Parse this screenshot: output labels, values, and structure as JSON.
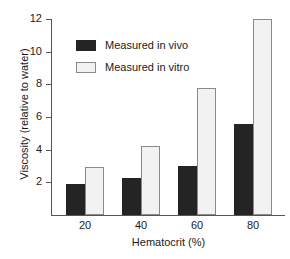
{
  "chart_data": {
    "type": "bar",
    "title": "",
    "xlabel": "Hematocrit (%)",
    "ylabel": "Viscosity (relative to water)",
    "categories": [
      "20",
      "40",
      "60",
      "80"
    ],
    "series": [
      {
        "name": "Measured in vivo",
        "values": [
          1.9,
          2.25,
          3.0,
          5.6
        ],
        "color": "#242424"
      },
      {
        "name": "Measured in vitro",
        "values": [
          2.95,
          4.25,
          7.8,
          12.0
        ],
        "color": "#f2f2f2"
      }
    ],
    "ylim": [
      0,
      12
    ],
    "yticks": [
      2,
      4,
      6,
      8,
      10,
      12
    ],
    "ytick_labels": [
      "2",
      "4",
      "6",
      "8",
      "10",
      "12"
    ],
    "xtick_labels": [
      "20",
      "40",
      "60",
      "80"
    ],
    "grid": false,
    "legend_position": "upper-left-inside",
    "legend": [
      {
        "label": "Measured in vivo",
        "swatch": "black-filled"
      },
      {
        "label": "Measured in vitro",
        "swatch": "white-outlined"
      }
    ]
  },
  "axis_colors": {
    "axis_line": "#555555",
    "text": "#1a1a1a",
    "background": "#ffffff"
  }
}
